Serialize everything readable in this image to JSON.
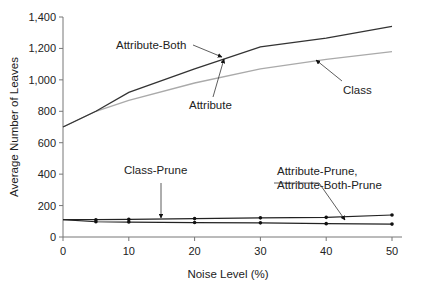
{
  "chart_data": {
    "type": "line",
    "title": "",
    "xlabel": "Noise Level (%)",
    "ylabel": "Average Number of Leaves",
    "x": [
      0,
      5,
      10,
      20,
      30,
      40,
      50
    ],
    "xticks": [
      "0",
      "10",
      "20",
      "30",
      "40",
      "50"
    ],
    "yticks": [
      "0",
      "200",
      "400",
      "600",
      "800",
      "1,000",
      "1,200",
      "1,400"
    ],
    "xlim": [
      0,
      50
    ],
    "ylim": [
      0,
      1400
    ],
    "grid": false,
    "legend": "none (inline annotations with arrows)",
    "series": [
      {
        "name": "Attribute-Both",
        "color": "#333333",
        "values": [
          700,
          800,
          920,
          1070,
          1210,
          1265,
          1340
        ]
      },
      {
        "name": "Attribute / Class",
        "color": "#aaaaaa",
        "values": [
          700,
          800,
          870,
          980,
          1070,
          1130,
          1180
        ]
      },
      {
        "name": "Class-Prune",
        "color": "#222222",
        "markers": true,
        "values": [
          110,
          110,
          112,
          117,
          122,
          125,
          140
        ]
      },
      {
        "name": "Attribute-Prune, Attribute-Both-Prune",
        "color": "#222222",
        "markers": true,
        "values": [
          110,
          97,
          95,
          92,
          90,
          85,
          82
        ]
      }
    ],
    "annotations": [
      {
        "text": "Attribute-Both",
        "x": 25,
        "y": 1150
      },
      {
        "text": "Attribute",
        "x": 24.5,
        "y": 1120
      },
      {
        "text": "Class",
        "x": 27,
        "y": 1130
      },
      {
        "text": "Class-Prune",
        "x": 15,
        "y": 120
      },
      {
        "text": "Attribute-Prune,",
        "x": 42.5,
        "y": 125
      },
      {
        "text": "Attribute-Both-Prune",
        "x": 42.5,
        "y": 125
      }
    ]
  },
  "labels": {
    "attribute_both": "Attribute-Both",
    "attribute": "Attribute",
    "class": "Class",
    "class_prune": "Class-Prune",
    "attr_prune_1": "Attribute-Prune,",
    "attr_prune_2": "Attribute-Both-Prune",
    "xlabel": "Noise Level (%)",
    "ylabel": "Average Number of Leaves"
  }
}
